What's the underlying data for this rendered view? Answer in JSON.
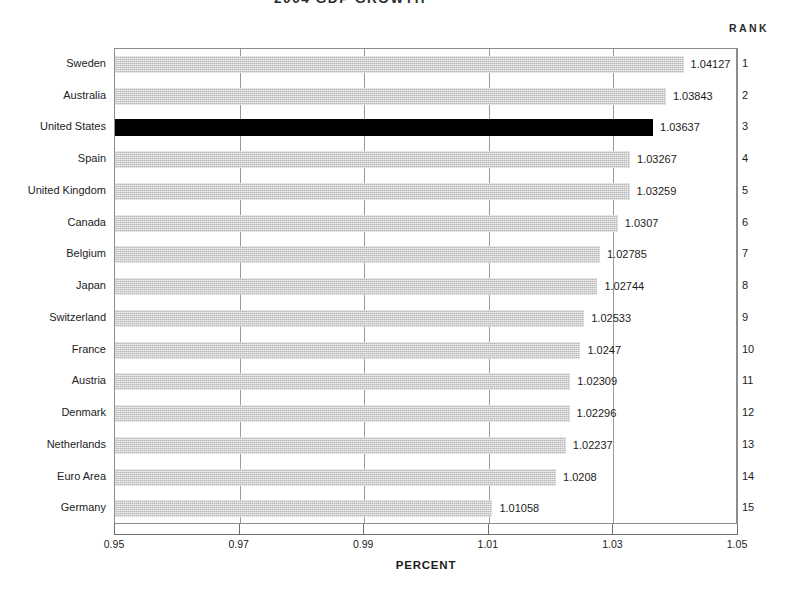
{
  "title": "2004  GDP  GROWTH",
  "rank_header": "RANK",
  "axis": {
    "x_title": "PERCENT",
    "x_ticks": [
      "0.95",
      "0.97",
      "0.99",
      "1.01",
      "1.03",
      "1.05"
    ]
  },
  "chart_data": {
    "type": "bar",
    "orientation": "horizontal",
    "title": "2004  GDP  GROWTH",
    "xlabel": "PERCENT",
    "ylabel": "",
    "xlim": [
      0.95,
      1.05
    ],
    "xticks": [
      0.95,
      0.97,
      0.99,
      1.01,
      1.03,
      1.05
    ],
    "grid": true,
    "grid_axis": "x",
    "legend": false,
    "highlight_color": "#000000",
    "bar_color": "#b9b9b9",
    "highlighted_category": "United States",
    "categories": [
      "Sweden",
      "Australia",
      "United States",
      "Spain",
      "United Kingdom",
      "Canada",
      "Belgium",
      "Japan",
      "Switzerland",
      "France",
      "Austria",
      "Denmark",
      "Netherlands",
      "Euro Area",
      "Germany"
    ],
    "values": [
      1.04127,
      1.03843,
      1.03637,
      1.03267,
      1.03259,
      1.0307,
      1.02785,
      1.02744,
      1.02533,
      1.0247,
      1.02309,
      1.02296,
      1.02237,
      1.0208,
      1.01058
    ],
    "value_labels": [
      "1.04127",
      "1.03843",
      "1.03637",
      "1.03267",
      "1.03259",
      "1.0307",
      "1.02785",
      "1.02744",
      "1.02533",
      "1.0247",
      "1.02309",
      "1.02296",
      "1.02237",
      "1.0208",
      "1.01058"
    ],
    "ranks": [
      "1",
      "2",
      "3",
      "4",
      "5",
      "6",
      "7",
      "8",
      "9",
      "10",
      "11",
      "12",
      "13",
      "14",
      "15"
    ]
  }
}
